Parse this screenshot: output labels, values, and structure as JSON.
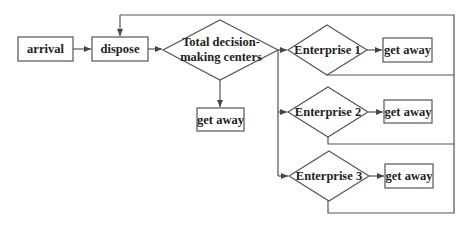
{
  "diagram": {
    "type": "flowchart",
    "nodes": {
      "arrival": {
        "label": "arrival",
        "shape": "rectangle"
      },
      "dispose": {
        "label": "dispose",
        "shape": "rectangle"
      },
      "total_center": {
        "label_line1": "Total decision-",
        "label_line2": "making centers",
        "shape": "diamond"
      },
      "get_away_center": {
        "label": "get away",
        "shape": "rectangle"
      },
      "enterprise_1": {
        "label": "Enterprise 1",
        "shape": "diamond"
      },
      "get_away_1": {
        "label": "get away",
        "shape": "rectangle"
      },
      "enterprise_2": {
        "label": "Enterprise 2",
        "shape": "diamond"
      },
      "get_away_2": {
        "label": "get away",
        "shape": "rectangle"
      },
      "enterprise_3": {
        "label": "Enterprise 3",
        "shape": "diamond"
      },
      "get_away_3": {
        "label": "get away",
        "shape": "rectangle"
      }
    },
    "edges": [
      {
        "from": "arrival",
        "to": "dispose"
      },
      {
        "from": "dispose",
        "to": "total_center"
      },
      {
        "from": "total_center",
        "to": "get_away_center"
      },
      {
        "from": "total_center",
        "to": "enterprise_1"
      },
      {
        "from": "total_center",
        "to": "enterprise_2"
      },
      {
        "from": "total_center",
        "to": "enterprise_3"
      },
      {
        "from": "enterprise_1",
        "to": "get_away_1"
      },
      {
        "from": "enterprise_2",
        "to": "get_away_2"
      },
      {
        "from": "enterprise_3",
        "to": "get_away_3"
      },
      {
        "from": "enterprise_1",
        "to": "dispose",
        "kind": "feedback"
      },
      {
        "from": "enterprise_2",
        "to": "dispose",
        "kind": "feedback"
      },
      {
        "from": "enterprise_3",
        "to": "dispose",
        "kind": "feedback"
      }
    ]
  }
}
